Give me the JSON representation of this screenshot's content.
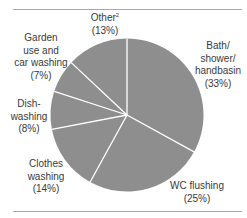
{
  "chart_data": {
    "type": "pie",
    "title": "",
    "start_angle_deg": 0,
    "direction": "clockwise",
    "fill_color": "#8e8e8e",
    "separator_color": "#ffffff",
    "slices": [
      {
        "name": "Bath/shower/handbasin",
        "value": 33,
        "label_lines": [
          "Bath/",
          "shower/",
          "handbasin",
          "(33%)"
        ]
      },
      {
        "name": "WC flushing",
        "value": 25,
        "label_lines": [
          "WC flushing",
          "(25%)"
        ]
      },
      {
        "name": "Clothes washing",
        "value": 14,
        "label_lines": [
          "Clothes",
          "washing",
          "(14%)"
        ]
      },
      {
        "name": "Dish-washing",
        "value": 8,
        "label_lines": [
          "Dish-",
          "washing",
          "(8%)"
        ]
      },
      {
        "name": "Garden use and car washing",
        "value": 7,
        "label_lines": [
          "Garden",
          "use and",
          "car washing",
          "(7%)"
        ]
      },
      {
        "name": "Other",
        "value": 13,
        "footnote": "2",
        "label_lines": [
          "Other",
          "(13%)"
        ]
      }
    ],
    "categories": [
      "Bath/shower/handbasin",
      "WC flushing",
      "Clothes washing",
      "Dish-washing",
      "Garden use and car washing",
      "Other"
    ],
    "values": [
      33,
      25,
      14,
      8,
      7,
      13
    ],
    "unit": "%"
  },
  "labels": {
    "bath": {
      "l1": "Bath/",
      "l2": "shower/",
      "l3": "handbasin",
      "pct": "(33%)"
    },
    "wc": {
      "l1": "WC flushing",
      "pct": "(25%)"
    },
    "clothes": {
      "l1": "Clothes",
      "l2": "washing",
      "pct": "(14%)"
    },
    "dish": {
      "l1": "Dish-",
      "l2": "washing",
      "pct": "(8%)"
    },
    "garden": {
      "l1": "Garden",
      "l2": "use and",
      "l3": "car washing",
      "pct": "(7%)"
    },
    "other": {
      "l1": "Other",
      "sup": "2",
      "pct": "(13%)"
    }
  }
}
